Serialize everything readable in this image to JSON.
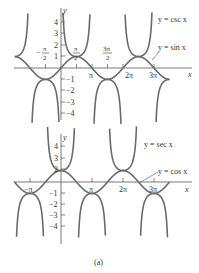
{
  "chart_data": [
    {
      "type": "line",
      "title": "",
      "xlabel": "x",
      "ylabel": "y",
      "ylim": [
        -4.5,
        4.5
      ],
      "xlim": [
        -4.6,
        11.5
      ],
      "x_ticks": [
        "-π/2",
        "π/2",
        "π",
        "3π/2",
        "2π",
        "3π"
      ],
      "y_ticks": [
        "4",
        "3",
        "2",
        "1",
        "-1",
        "-2",
        "-3",
        "-4"
      ],
      "series": [
        {
          "name": "y = csc x",
          "function": "csc(x)"
        },
        {
          "name": "y = sin x",
          "function": "sin(x)"
        }
      ],
      "annotations": [
        "y = csc x",
        "y = sin x"
      ]
    },
    {
      "type": "line",
      "title": "",
      "xlabel": "x",
      "ylabel": "y",
      "ylim": [
        -4.5,
        4.5
      ],
      "xlim": [
        -4.6,
        11.5
      ],
      "x_ticks": [
        "-π",
        "π",
        "2π",
        "3π"
      ],
      "y_ticks": [
        "4",
        "3",
        "2",
        "-1",
        "-2",
        "-3",
        "-4"
      ],
      "series": [
        {
          "name": "y = sec x",
          "function": "sec(x)"
        },
        {
          "name": "y = cos x",
          "function": "cos(x)"
        }
      ],
      "annotations": [
        "y = sec x",
        "y = cos x"
      ]
    }
  ],
  "top": {
    "y_axis_label": "y",
    "x_axis_label": "x",
    "y_ticks": [
      "4",
      "3",
      "2",
      "1",
      "−1",
      "−2",
      "−3",
      "−4"
    ],
    "x_ticks": {
      "neg_half_pi_num": "π",
      "neg_half_pi_den": "2",
      "neg_sign": "−",
      "half_pi_num": "π",
      "half_pi_den": "2",
      "pi": "π",
      "three_half_pi_num": "3π",
      "three_half_pi_den": "2",
      "two_pi": "2π",
      "three_pi": "3π"
    },
    "legend_csc": "y = csc x",
    "legend_sin": "y = sin x"
  },
  "bottom": {
    "y_axis_label": "y",
    "x_axis_label": "x",
    "y_ticks": [
      "4",
      "3",
      "2",
      "−1",
      "−2",
      "−3",
      "−4"
    ],
    "x_ticks": {
      "neg_pi": "−π",
      "pi": "π",
      "two_pi": "2π",
      "three_pi": "3π"
    },
    "legend_sec": "y = sec x",
    "legend_cos": "y = cos x"
  },
  "caption": "(a)",
  "colors": {
    "curve": "#6a6a6a",
    "axis": "#555555",
    "text": "#333333"
  }
}
